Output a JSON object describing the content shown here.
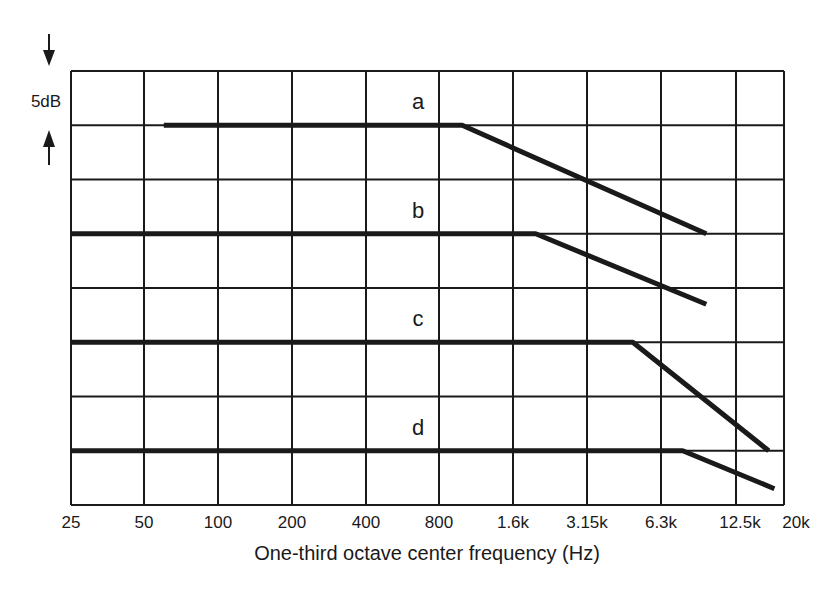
{
  "chart_data": {
    "type": "line",
    "title": "",
    "xlabel": "One-third octave center frequency (Hz)",
    "ylabel": "",
    "x_scale": "log (one-third octave bands)",
    "x_tick_labels": [
      "25",
      "50",
      "100",
      "200",
      "400",
      "800",
      "1.6k",
      "3.15k",
      "6.3k",
      "12.5k",
      "20k"
    ],
    "x_tick_values": [
      25,
      50,
      100,
      200,
      400,
      800,
      1600,
      3150,
      6300,
      12500,
      20000
    ],
    "y_scale_annotation": "5dB",
    "y_grid_step_db": 5,
    "y_grid_rows": 8,
    "grid": true,
    "legend": "inline curve labels a, b, c, d",
    "series": [
      {
        "name": "a",
        "points": [
          {
            "freq": 60,
            "level_db": -5
          },
          {
            "freq": 1000,
            "level_db": -5
          },
          {
            "freq": 10000,
            "level_db": -15
          }
        ]
      },
      {
        "name": "b",
        "points": [
          {
            "freq": 25,
            "level_db": -15
          },
          {
            "freq": 2000,
            "level_db": -15
          },
          {
            "freq": 10000,
            "level_db": -21.5
          }
        ]
      },
      {
        "name": "c",
        "points": [
          {
            "freq": 25,
            "level_db": -25
          },
          {
            "freq": 5000,
            "level_db": -25
          },
          {
            "freq": 18000,
            "level_db": -35
          }
        ]
      },
      {
        "name": "d",
        "points": [
          {
            "freq": 25,
            "level_db": -35
          },
          {
            "freq": 8000,
            "level_db": -35
          },
          {
            "freq": 19000,
            "level_db": -38.5
          }
        ]
      }
    ],
    "curve_label_positions": [
      {
        "name": "a",
        "freq": 900,
        "level_db": -3.5
      },
      {
        "name": "b",
        "freq": 900,
        "level_db": -13.5
      },
      {
        "name": "c",
        "freq": 900,
        "level_db": -23.5
      },
      {
        "name": "d",
        "freq": 900,
        "level_db": -33.5
      }
    ]
  },
  "scale_indicator": {
    "label": "5dB",
    "arrow_top": "down-arrow",
    "arrow_bottom": "up-arrow"
  },
  "colors": {
    "ink": "#1a1a1a",
    "background": "#ffffff"
  }
}
